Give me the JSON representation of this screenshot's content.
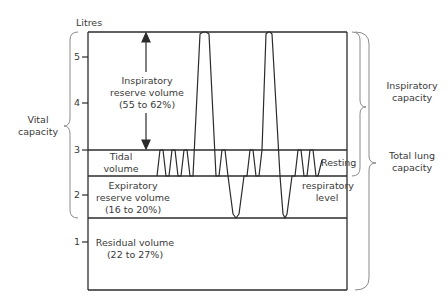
{
  "diagram": {
    "y_axis_label": "Litres",
    "y_ticks": [
      "5",
      "4",
      "3",
      "2",
      "1"
    ],
    "regions": {
      "inspiratory_reserve": {
        "line1": "Inspiratory",
        "line2": "reserve volume",
        "line3": "(55 to 62%)"
      },
      "tidal": {
        "line1": "Tidal",
        "line2": "volume"
      },
      "expiratory_reserve": {
        "line1": "Expiratory",
        "line2": "reserve volume",
        "line3": "(16 to 20%)"
      },
      "residual": {
        "line1": "Residual volume",
        "line2": "(22 to 27%)"
      }
    },
    "brackets": {
      "vital_capacity": {
        "line1": "Vital",
        "line2": "capacity"
      },
      "inspiratory_capacity": {
        "line1": "Inspiratory",
        "line2": "capacity"
      },
      "total_lung_capacity": {
        "line1": "Total lung",
        "line2": "capacity"
      }
    },
    "resting_level": {
      "line1": "Resting",
      "line2": "respiratory",
      "line3": "level"
    },
    "colors": {
      "line": "#2b2b2b",
      "bracket": "#8a8a8a",
      "text": "#3a3a3a"
    }
  }
}
